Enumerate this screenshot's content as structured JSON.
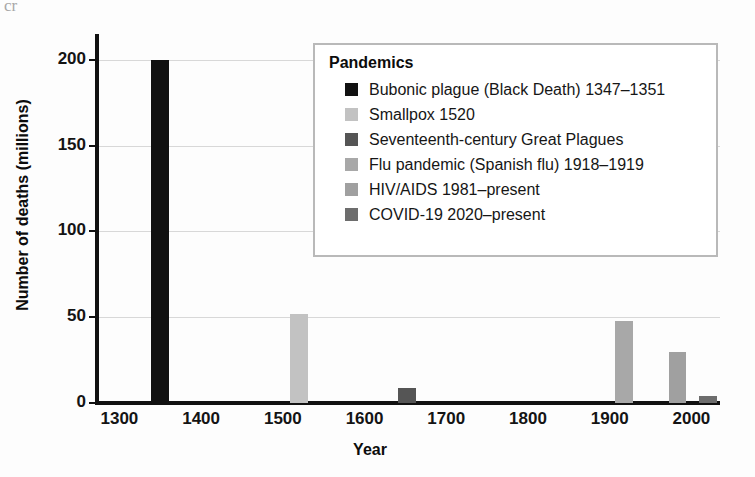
{
  "artifact_text": "cr",
  "chart_data": {
    "type": "bar",
    "title": "",
    "xlabel": "Year",
    "ylabel": "Number of deaths (millions)",
    "xlim": [
      1275,
      2035
    ],
    "ylim": [
      0,
      215
    ],
    "xticks": [
      "1300",
      "1400",
      "1500",
      "1600",
      "1700",
      "1800",
      "1900",
      "2000"
    ],
    "xtick_values": [
      1300,
      1400,
      1500,
      1600,
      1700,
      1800,
      1900,
      2000
    ],
    "yticks": [
      "0",
      "50",
      "100",
      "150",
      "200"
    ],
    "ytick_values": [
      0,
      50,
      100,
      150,
      200
    ],
    "grid": "horizontal",
    "legend_position": "upper-right-inside",
    "bar_width_years": 22,
    "categories": [
      "Bubonic plague (Black Death) 1347–1351",
      "Smallpox 1520",
      "Seventeenth-century Great Plagues",
      "Flu pandemic (Spanish flu) 1918–1919",
      "HIV/AIDS 1981–present",
      "COVID-19 2020–present"
    ],
    "x": [
      1350,
      1520,
      1652,
      1918,
      1983,
      2020
    ],
    "values": [
      200,
      52,
      9,
      48,
      30,
      4
    ],
    "colors": [
      "#111111",
      "#c2c2c2",
      "#555555",
      "#a8a8a8",
      "#a0a0a0",
      "#6d6d6d"
    ]
  },
  "legend": {
    "title": "Pandemics",
    "items": [
      {
        "label": "Bubonic plague (Black Death) 1347–1351",
        "color": "#111111"
      },
      {
        "label": "Smallpox 1520",
        "color": "#c2c2c2"
      },
      {
        "label": "Seventeenth-century Great Plagues",
        "color": "#555555"
      },
      {
        "label": "Flu pandemic (Spanish flu) 1918–1919",
        "color": "#a8a8a8"
      },
      {
        "label": "HIV/AIDS 1981–present",
        "color": "#a0a0a0"
      },
      {
        "label": "COVID-19 2020–present",
        "color": "#6d6d6d"
      }
    ]
  }
}
